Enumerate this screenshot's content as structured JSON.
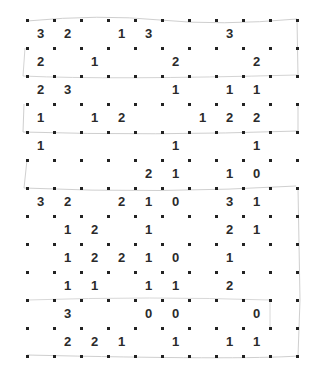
{
  "puzzle": {
    "type": "slitherlink",
    "rows": 12,
    "cols": 10,
    "origin": {
      "x": 27,
      "y": 20
    },
    "cell_w": 27,
    "cell_h": 28,
    "colors": {
      "dot": "#222222",
      "clue": "#2a2a2a",
      "sketch": "#c8c8c8"
    },
    "clues": [
      [
        "3",
        "2",
        "",
        "1",
        "3",
        "",
        "",
        "3",
        "",
        ""
      ],
      [
        "2",
        "",
        "1",
        "",
        "",
        "2",
        "",
        "",
        "2",
        ""
      ],
      [
        "2",
        "3",
        "",
        "",
        "",
        "1",
        "",
        "1",
        "1",
        ""
      ],
      [
        "1",
        "",
        "1",
        "2",
        "",
        "",
        "1",
        "2",
        "2",
        ""
      ],
      [
        "1",
        "",
        "",
        "",
        "",
        "1",
        "",
        "",
        "1",
        ""
      ],
      [
        "",
        "",
        "",
        "",
        "2",
        "1",
        "",
        "1",
        "0",
        ""
      ],
      [
        "3",
        "2",
        "",
        "2",
        "1",
        "0",
        "",
        "3",
        "1",
        ""
      ],
      [
        "",
        "1",
        "2",
        "",
        "1",
        "",
        "",
        "2",
        "1",
        ""
      ],
      [
        "",
        "1",
        "2",
        "2",
        "1",
        "0",
        "",
        "1",
        "",
        ""
      ],
      [
        "",
        "1",
        "1",
        "",
        "1",
        "1",
        "",
        "2",
        "",
        ""
      ],
      [
        "",
        "3",
        "",
        "",
        "0",
        "0",
        "",
        "",
        "0",
        ""
      ],
      [
        "",
        "2",
        "2",
        "1",
        "",
        "1",
        "",
        "1",
        "1",
        ""
      ]
    ]
  }
}
